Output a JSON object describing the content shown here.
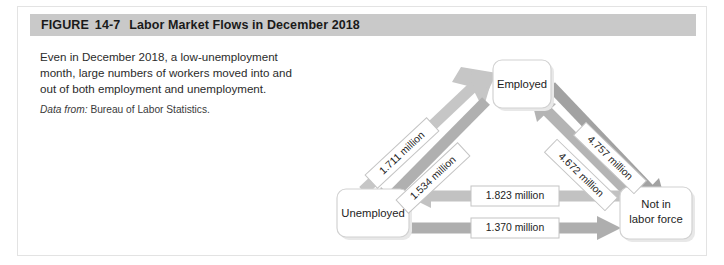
{
  "figure": {
    "label": "FIGURE",
    "number": "14-7",
    "title": "Labor Market Flows in December 2018"
  },
  "caption": {
    "body": "Even in December 2018, a low-unemployment month, large numbers of workers moved into and out of both employment and unemployment.",
    "source_label": "Data from:",
    "source_value": "Bureau of Labor Statistics."
  },
  "diagram": {
    "nodes": {
      "employed": "Employed",
      "unemployed": "Unemployed",
      "not_in_labor_force_line1": "Not in",
      "not_in_labor_force_line2": "labor force"
    },
    "flows": {
      "unemployed_to_employed": "1.711 million",
      "employed_to_unemployed": "1.534 million",
      "employed_to_nilf": "4.757 million",
      "nilf_to_employed": "4.672 million",
      "nilf_to_unemployed": "1.823 million",
      "unemployed_to_nilf": "1.370 million"
    }
  },
  "colors": {
    "header_band": "#c9c9c9",
    "arrow_light": "#c5c5c5",
    "arrow_dark": "#a8a8a8",
    "card_border": "#e3e3e3",
    "node_border": "#d2d2d2"
  }
}
